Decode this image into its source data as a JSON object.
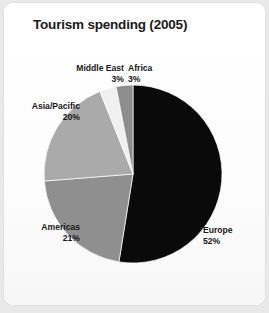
{
  "card": {
    "background_color": "#ffffff",
    "page_background_color": "#e9e9e9"
  },
  "chart_data": {
    "type": "pie",
    "title": "Tourism spending (2005)",
    "xlabel": "",
    "ylabel": "",
    "unit": "%",
    "start_angle_deg": 0,
    "direction": "clockwise",
    "legend": "none (direct labels)",
    "grid": false,
    "categories": [
      "Europe",
      "Americas",
      "Asia/Pacific",
      "Middle East",
      "Africa"
    ],
    "values": [
      52,
      21,
      20,
      3,
      3
    ],
    "slices": [
      {
        "label": "Europe",
        "value": 52,
        "value_text": "52%",
        "color": "#0a0a0a"
      },
      {
        "label": "Americas",
        "value": 21,
        "value_text": "21%",
        "color": "#8f8f8f"
      },
      {
        "label": "Asia/Pacific",
        "value": 20,
        "value_text": "20%",
        "color": "#aaaaaa"
      },
      {
        "label": "Middle East",
        "value": 3,
        "value_text": "3%",
        "color": "#f0f0f0"
      },
      {
        "label": "Africa",
        "value": 3,
        "value_text": "3%",
        "color": "#8d8d8d"
      }
    ],
    "labels": {
      "middle_east": {
        "name": "Middle East",
        "value_text": "3%"
      },
      "africa": {
        "name": "Africa",
        "value_text": "3%"
      },
      "asia": {
        "name": "Asia/Pacific",
        "value_text": "20%"
      },
      "americas": {
        "name": "Americas",
        "value_text": "21%"
      },
      "europe": {
        "name": "Europe",
        "value_text": "52%"
      }
    },
    "geometry": {
      "center_x": 129,
      "center_y": 171,
      "radius": 89
    }
  }
}
